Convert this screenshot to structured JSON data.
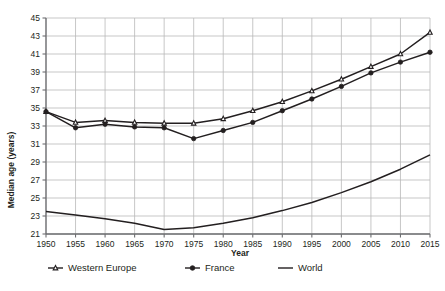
{
  "chart_data": {
    "type": "line",
    "title": "",
    "subtitle": "",
    "xlabel": "Year",
    "ylabel": "Median age (years)",
    "x": [
      1950,
      1955,
      1960,
      1965,
      1970,
      1975,
      1980,
      1985,
      1990,
      1995,
      2000,
      2005,
      2010,
      2015
    ],
    "xticklabels": [
      "1950",
      "1955",
      "1960",
      "1965",
      "1970",
      "1975",
      "1980",
      "1985",
      "1990",
      "1995",
      "2000",
      "2005",
      "2010",
      "2015"
    ],
    "yticklabels": [
      "21",
      "23",
      "25",
      "27",
      "29",
      "31",
      "33",
      "35",
      "37",
      "39",
      "41",
      "43",
      "45"
    ],
    "xlim": [
      1950,
      2015
    ],
    "ylim": [
      21,
      45
    ],
    "ytick_step": 2,
    "grid": true,
    "legend_position": "bottom",
    "series": [
      {
        "name": "Western Europe",
        "marker": "open-triangle",
        "color": "#231f20",
        "values": [
          34.6,
          33.4,
          33.6,
          33.4,
          33.3,
          33.3,
          33.8,
          34.7,
          35.7,
          36.9,
          38.2,
          39.6,
          41.0,
          43.4
        ]
      },
      {
        "name": "France",
        "marker": "filled-circle",
        "color": "#231f20",
        "values": [
          34.6,
          32.8,
          33.2,
          32.9,
          32.8,
          31.6,
          32.5,
          33.4,
          34.7,
          36.0,
          37.4,
          38.9,
          40.1,
          41.2
        ]
      },
      {
        "name": "World",
        "marker": "none",
        "color": "#231f20",
        "values": [
          23.5,
          23.1,
          22.7,
          22.2,
          21.5,
          21.7,
          22.2,
          22.8,
          23.6,
          24.5,
          25.6,
          26.8,
          28.2,
          29.8
        ]
      }
    ]
  },
  "legend": {
    "items": [
      {
        "label": "Western Europe",
        "marker": "open-triangle"
      },
      {
        "label": "France",
        "marker": "filled-circle"
      },
      {
        "label": "World",
        "marker": "plain-line"
      }
    ]
  },
  "colors": {
    "line": "#231f20",
    "grid": "#b9b9b9",
    "axis": "#6d6e71",
    "background": "#ffffff",
    "marker_fill": "#ffffff"
  }
}
